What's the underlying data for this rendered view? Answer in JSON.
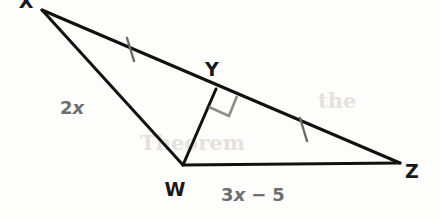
{
  "figure": {
    "kind": "geometry-diagram",
    "width": 439,
    "height": 219,
    "background_color": "#fdfdfc"
  },
  "colors": {
    "stroke": "#111111",
    "tick": "#6b6b6b",
    "right_angle": "#8d8d8d",
    "vertex_label": "#191919",
    "side_label": "#6e6e6e",
    "ghost": "#e2ddd6"
  },
  "vertices": [
    {
      "id": "X",
      "label": "X",
      "x": 42,
      "y": 10,
      "label_x": 26,
      "label_y": 8,
      "clipped": true
    },
    {
      "id": "Y",
      "label": "Y",
      "x": 216,
      "y": 89,
      "label_x": 212,
      "label_y": 76,
      "clipped": false
    },
    {
      "id": "W",
      "label": "W",
      "x": 183,
      "y": 165,
      "label_x": 175,
      "label_y": 196,
      "clipped": false
    },
    {
      "id": "Z",
      "label": "Z",
      "x": 400,
      "y": 163,
      "label_x": 412,
      "label_y": 178,
      "clipped": false
    }
  ],
  "segments": [
    {
      "id": "XZ",
      "from": "X",
      "to": "Z",
      "style": "solid",
      "width": 3
    },
    {
      "id": "XW",
      "from": "X",
      "to": "W",
      "style": "solid",
      "width": 3
    },
    {
      "id": "WZ",
      "from": "W",
      "to": "Z",
      "style": "solid",
      "width": 3
    },
    {
      "id": "WY",
      "from": "W",
      "to": "Y",
      "style": "solid",
      "width": 3
    }
  ],
  "tick_marks": [
    {
      "id": "tick-XY",
      "on_segment": "XY",
      "count": 1,
      "cx": 130,
      "cy": 49,
      "angle_deg": 24
    },
    {
      "id": "tick-YZ",
      "on_segment": "YZ",
      "count": 1,
      "cx": 303,
      "cy": 129,
      "angle_deg": 22
    }
  ],
  "right_angle": {
    "id": "right-angle-Y",
    "at_vertex": "Y",
    "size": 22,
    "label": "right angle"
  },
  "side_labels": [
    {
      "id": "label-2x",
      "text": "2x",
      "coefficient": "2",
      "variable": "x",
      "operator": "",
      "constant": "",
      "on_segment": "XW",
      "x": 72,
      "y": 114
    },
    {
      "id": "label-3x-5",
      "text": "3x − 5",
      "coefficient": "3",
      "variable": "x",
      "operator": "−",
      "constant": "5",
      "on_segment": "WZ",
      "x": 253,
      "y": 201
    }
  ],
  "ghost_artifacts": [
    {
      "id": "ghost-1",
      "text": "Theorem",
      "x": 140,
      "y": 150
    },
    {
      "id": "ghost-2",
      "text": "the",
      "x": 318,
      "y": 108
    }
  ]
}
